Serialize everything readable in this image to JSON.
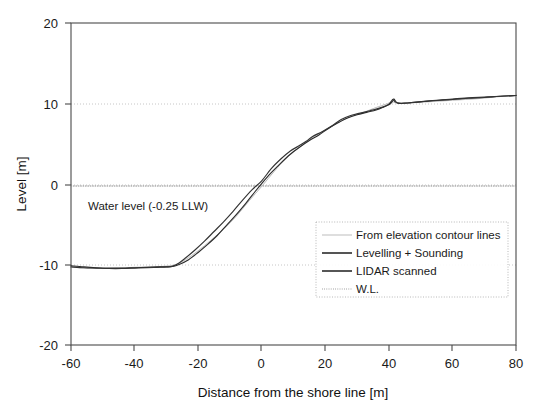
{
  "chart_data": {
    "type": "line",
    "title": "",
    "xlabel": "Distance from the shore line [m]",
    "ylabel": "Level [m]",
    "xlim": [
      -60,
      80
    ],
    "ylim": [
      -20,
      20
    ],
    "xticks": [
      -60,
      -40,
      -20,
      0,
      20,
      40,
      60,
      80
    ],
    "yticks": [
      -20,
      -10,
      0,
      10,
      20
    ],
    "xtick_labels": [
      "-60",
      "-40",
      "-20",
      "0",
      "20",
      "40",
      "60",
      "80"
    ],
    "ytick_labels": [
      "-20",
      "-10",
      "0",
      "10",
      "20"
    ],
    "grid": "horizontal-dotted",
    "legend_position": "lower-right-inside",
    "annotations": [
      {
        "name": "water-level-annotation",
        "text": "Water level (-0.25 LLW)",
        "x": -47,
        "y": -2.6
      }
    ],
    "series": [
      {
        "name": "From elevation contour lines",
        "style": "solid-light",
        "color": "#b9b9b9",
        "x": [
          -60,
          -55,
          -50,
          -45,
          -40,
          -35,
          -30,
          -27,
          -24,
          -20,
          -16,
          -12,
          -8,
          -4,
          0,
          4,
          8,
          12,
          16,
          20,
          24,
          28,
          32,
          36,
          39,
          41,
          42,
          44,
          48,
          52,
          56,
          60,
          64,
          68,
          72,
          76,
          80
        ],
        "y": [
          -10.3,
          -10.45,
          -10.5,
          -10.45,
          -10.35,
          -10.3,
          -10.2,
          -10.0,
          -9.4,
          -8.3,
          -7.0,
          -5.6,
          -4.0,
          -2.1,
          -0.3,
          1.6,
          3.3,
          4.6,
          5.8,
          6.7,
          7.6,
          8.4,
          8.9,
          9.5,
          9.9,
          10.2,
          10.1,
          10.05,
          10.1,
          10.2,
          10.3,
          10.4,
          10.5,
          10.6,
          10.75,
          10.9,
          11.0
        ]
      },
      {
        "name": "Levelling + Sounding",
        "style": "solid-dark",
        "color": "#2b2b2b",
        "x": [
          -60,
          -56,
          -52,
          -48,
          -44,
          -40,
          -36,
          -32,
          -30,
          -28,
          -26,
          -23,
          -20,
          -17,
          -14,
          -11,
          -8,
          -5,
          -2,
          0,
          3,
          6,
          9,
          12,
          15,
          18,
          21,
          24,
          27,
          30,
          33,
          36,
          38,
          40,
          41,
          41.6,
          42.5,
          44,
          47,
          51,
          55,
          60,
          65,
          70,
          75,
          80
        ],
        "y": [
          -10.15,
          -10.3,
          -10.4,
          -10.45,
          -10.45,
          -10.4,
          -10.35,
          -10.3,
          -10.3,
          -10.25,
          -10.0,
          -9.4,
          -8.5,
          -7.5,
          -6.4,
          -5.1,
          -3.8,
          -2.4,
          -0.9,
          0.05,
          1.4,
          2.6,
          3.7,
          4.6,
          5.4,
          6.1,
          6.9,
          7.6,
          8.2,
          8.6,
          8.9,
          9.2,
          9.5,
          9.9,
          10.4,
          10.55,
          10.1,
          10.0,
          10.1,
          10.25,
          10.4,
          10.5,
          10.65,
          10.75,
          10.9,
          11.0
        ]
      },
      {
        "name": "LIDAR scanned",
        "style": "solid-dark",
        "color": "#333333",
        "x": [
          -60,
          -56,
          -52,
          -48,
          -44,
          -40,
          -36,
          -33,
          -30,
          -28,
          -26,
          -24,
          -21,
          -18,
          -15,
          -12,
          -9,
          -6,
          -3,
          0,
          3,
          6,
          9,
          12,
          14,
          16,
          19,
          22,
          25,
          28,
          31,
          34,
          36,
          38,
          40,
          41,
          41.5,
          42,
          43,
          45,
          48,
          52,
          56,
          60,
          65,
          70,
          75,
          80
        ],
        "y": [
          -10.3,
          -10.4,
          -10.45,
          -10.5,
          -10.5,
          -10.45,
          -10.4,
          -10.35,
          -10.3,
          -10.2,
          -9.8,
          -9.2,
          -8.2,
          -7.1,
          -5.9,
          -4.7,
          -3.4,
          -2.0,
          -0.7,
          0.4,
          1.9,
          3.1,
          4.1,
          4.8,
          5.3,
          5.9,
          6.5,
          7.2,
          8.0,
          8.5,
          8.8,
          9.1,
          9.3,
          9.55,
          9.85,
          10.2,
          10.45,
          10.2,
          10.05,
          10.05,
          10.15,
          10.3,
          10.4,
          10.55,
          10.7,
          10.8,
          10.9,
          11.0
        ]
      },
      {
        "name": "W.L.",
        "style": "fine-dotted",
        "color": "#8d8d8d",
        "x": [
          -60,
          80
        ],
        "y": [
          -0.25,
          -0.25
        ],
        "description": "Water level line at -0.25 LLW"
      }
    ]
  },
  "legend": {
    "entries": [
      {
        "label": "From elevation contour lines",
        "swatch": "line-light"
      },
      {
        "label": "Levelling + Sounding",
        "swatch": "line-solid"
      },
      {
        "label": "LIDAR scanned",
        "swatch": "line-solid"
      },
      {
        "label": "W.L.",
        "swatch": "line-dotted"
      }
    ]
  }
}
